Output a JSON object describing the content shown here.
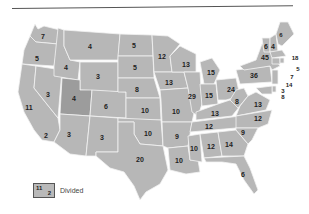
{
  "map": {
    "type": "us-states-choropleth",
    "colors": {
      "state_fill": "#b7b7b7",
      "state_fill_dark": "#9c9c9c",
      "border": "#f2f2f2",
      "water": "#ffffff",
      "label": "#222222"
    },
    "states": [
      {
        "id": "WA",
        "value": "7",
        "x": 43,
        "y": 36
      },
      {
        "id": "OR",
        "value": "5",
        "x": 37,
        "y": 58
      },
      {
        "id": "CA-N",
        "value": "11",
        "x": 29,
        "y": 107
      },
      {
        "id": "CA-S",
        "value": "2",
        "x": 46,
        "y": 135
      },
      {
        "id": "NV",
        "value": "3",
        "x": 48,
        "y": 94
      },
      {
        "id": "ID",
        "value": "4",
        "x": 66,
        "y": 67
      },
      {
        "id": "MT",
        "value": "4",
        "x": 90,
        "y": 46
      },
      {
        "id": "WY",
        "value": "3",
        "x": 98,
        "y": 76
      },
      {
        "id": "UT",
        "value": "4",
        "x": 74,
        "y": 98
      },
      {
        "id": "CO",
        "value": "6",
        "x": 106,
        "y": 106
      },
      {
        "id": "AZ",
        "value": "3",
        "x": 69,
        "y": 134
      },
      {
        "id": "NM",
        "value": "3",
        "x": 102,
        "y": 137
      },
      {
        "id": "ND",
        "value": "5",
        "x": 134,
        "y": 45
      },
      {
        "id": "SD",
        "value": "5",
        "x": 135,
        "y": 67
      },
      {
        "id": "NE",
        "value": "8",
        "x": 137,
        "y": 89
      },
      {
        "id": "KS",
        "value": "10",
        "x": 145,
        "y": 110
      },
      {
        "id": "OK",
        "value": "10",
        "x": 148,
        "y": 133
      },
      {
        "id": "TX",
        "value": "20",
        "x": 140,
        "y": 159
      },
      {
        "id": "MN",
        "value": "12",
        "x": 162,
        "y": 56
      },
      {
        "id": "IA",
        "value": "13",
        "x": 169,
        "y": 82
      },
      {
        "id": "MO",
        "value": "10",
        "x": 176,
        "y": 111
      },
      {
        "id": "AR",
        "value": "9",
        "x": 177,
        "y": 136
      },
      {
        "id": "LA",
        "value": "10",
        "x": 179,
        "y": 160
      },
      {
        "id": "WI",
        "value": "13",
        "x": 186,
        "y": 64
      },
      {
        "id": "IL",
        "value": "29",
        "x": 192,
        "y": 96
      },
      {
        "id": "MS",
        "value": "10",
        "x": 194,
        "y": 148
      },
      {
        "id": "MI",
        "value": "15",
        "x": 211,
        "y": 72
      },
      {
        "id": "IN",
        "value": "15",
        "x": 209,
        "y": 95
      },
      {
        "id": "KY",
        "value": "13",
        "x": 215,
        "y": 113
      },
      {
        "id": "TN",
        "value": "12",
        "x": 209,
        "y": 126
      },
      {
        "id": "AL",
        "value": "12",
        "x": 211,
        "y": 146
      },
      {
        "id": "OH",
        "value": "24",
        "x": 231,
        "y": 89
      },
      {
        "id": "WV",
        "value": "8",
        "x": 237,
        "y": 101
      },
      {
        "id": "GA",
        "value": "14",
        "x": 229,
        "y": 144
      },
      {
        "id": "FL",
        "value": "6",
        "x": 243,
        "y": 174
      },
      {
        "id": "VA",
        "value": "13",
        "x": 258,
        "y": 104
      },
      {
        "id": "NC",
        "value": "12",
        "x": 258,
        "y": 118
      },
      {
        "id": "SC",
        "value": "9",
        "x": 243,
        "y": 132
      },
      {
        "id": "PA",
        "value": "36",
        "x": 254,
        "y": 75
      },
      {
        "id": "NY",
        "value": "45",
        "x": 265,
        "y": 57
      },
      {
        "id": "VT",
        "value": "6",
        "x": 266,
        "y": 46
      },
      {
        "id": "NH",
        "value": "4",
        "x": 273,
        "y": 46
      },
      {
        "id": "ME",
        "value": "6",
        "x": 281,
        "y": 35
      },
      {
        "id": "MA",
        "value": "18",
        "x": 295,
        "y": 58
      },
      {
        "id": "RI",
        "value": "5",
        "x": 298,
        "y": 69
      },
      {
        "id": "CT",
        "value": "7",
        "x": 292,
        "y": 77
      },
      {
        "id": "NJ",
        "value": "14",
        "x": 289,
        "y": 85
      },
      {
        "id": "DE",
        "value": "3",
        "x": 283,
        "y": 91
      },
      {
        "id": "MD",
        "value": "8",
        "x": 283,
        "y": 97
      }
    ]
  },
  "legend": {
    "swatch_top": "11",
    "swatch_bottom": "2",
    "label": "Divided"
  }
}
